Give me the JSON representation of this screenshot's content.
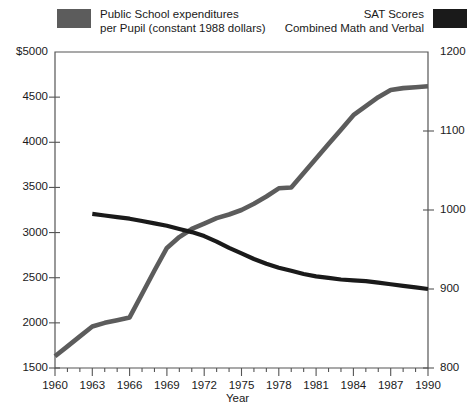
{
  "legend": {
    "left": {
      "swatch_color": "#5c5c5c",
      "line1": "Public School expenditures",
      "line2": "per Pupil (constant 1988 dollars)",
      "swatch_name": "expenditures-swatch"
    },
    "right": {
      "swatch_color": "#1a1a1a",
      "line1": "SAT Scores",
      "line2": "Combined Math and Verbal",
      "swatch_name": "sat-swatch"
    }
  },
  "axes": {
    "y_left_ticks": [
      "$5000",
      "4500",
      "4000",
      "3500",
      "3000",
      "2500",
      "2000",
      "1500"
    ],
    "y_right_ticks": [
      "1200",
      "1100",
      "1000",
      "900",
      "800"
    ],
    "x_ticks": [
      "1960",
      "1963",
      "1966",
      "1969",
      "1972",
      "1975",
      "1978",
      "1981",
      "1984",
      "1987",
      "1990"
    ],
    "x_title": "Year"
  },
  "chart_data": {
    "type": "line",
    "title": "",
    "xlabel": "Year",
    "ylabel": "Public School expenditures per Pupil (constant 1988 dollars)",
    "y2label": "SAT Scores Combined Math and Verbal",
    "xlim": [
      1960,
      1990
    ],
    "ylim": [
      1500,
      5000
    ],
    "y2lim": [
      800,
      1200
    ],
    "grid": false,
    "legend_position": "top",
    "x": [
      1960,
      1961,
      1962,
      1963,
      1964,
      1965,
      1966,
      1967,
      1968,
      1969,
      1970,
      1971,
      1972,
      1973,
      1974,
      1975,
      1976,
      1977,
      1978,
      1979,
      1980,
      1981,
      1982,
      1983,
      1984,
      1985,
      1986,
      1987,
      1988,
      1989,
      1990
    ],
    "series": [
      {
        "name": "Public School expenditures per Pupil (constant 1988 dollars)",
        "axis": "left",
        "color": "#5c5c5c",
        "units": "constant 1988 dollars",
        "values": [
          1630,
          1740,
          1850,
          1960,
          2000,
          2030,
          2060,
          2320,
          2580,
          2830,
          2950,
          3040,
          3100,
          3160,
          3200,
          3250,
          3320,
          3400,
          3490,
          3500,
          3660,
          3820,
          3980,
          4140,
          4300,
          4400,
          4500,
          4580,
          4600,
          4610,
          4620
        ]
      },
      {
        "name": "SAT Scores Combined Math and Verbal",
        "axis": "right",
        "color": "#1a1a1a",
        "units": "points",
        "values": [
          null,
          null,
          null,
          995,
          993,
          991,
          989,
          986,
          983,
          980,
          976,
          972,
          967,
          960,
          952,
          945,
          938,
          932,
          927,
          923,
          919,
          916,
          914,
          912,
          911,
          910,
          908,
          906,
          904,
          902,
          900
        ]
      }
    ]
  }
}
